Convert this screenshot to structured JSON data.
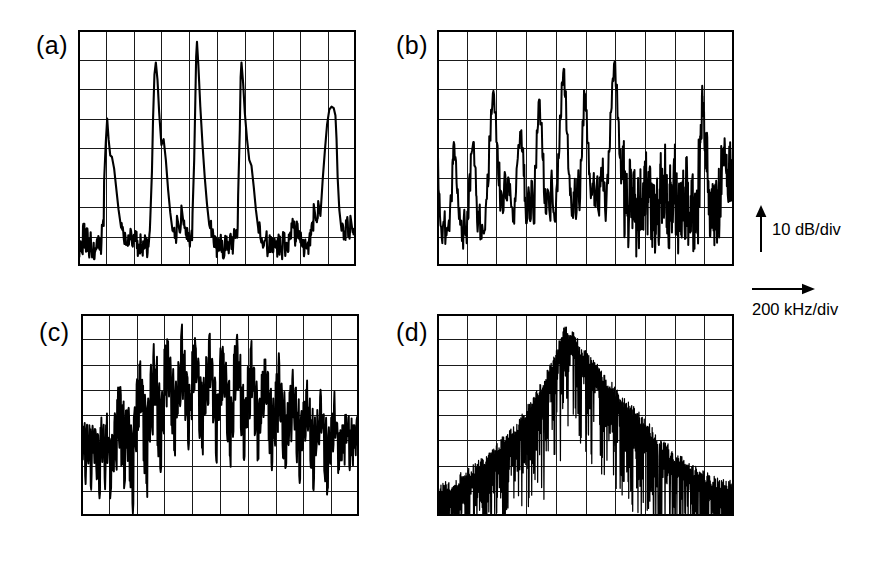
{
  "figure": {
    "type": "spectrum-analyzer-panels",
    "background_color": "#ffffff",
    "trace_color": "#000000",
    "grid_color": "#1a1a1a",
    "panel_count": 4
  },
  "labels": {
    "a": "(a)",
    "b": "(b)",
    "c": "(c)",
    "d": "(d)"
  },
  "legend": {
    "vertical_axis": "10 dB/div",
    "horizontal_axis": "200 kHz/div",
    "vertical_arrow_icon": "up-arrow-icon",
    "horizontal_arrow_icon": "right-arrow-icon"
  },
  "chart_data": [
    {
      "id": "a",
      "type": "line",
      "title": "(a)",
      "xlabel": "200 kHz/div",
      "ylabel": "10 dB/div",
      "xlim": [
        0,
        10
      ],
      "ylim": [
        0,
        8
      ],
      "grid": true,
      "x_divisions": 10,
      "y_divisions": 8,
      "description": "Periodic comb of sharp spectral peaks with low noise floor",
      "peaks_x": [
        1.05,
        2.7,
        4.25,
        5.85,
        7.75,
        9.3
      ],
      "peaks_y": [
        5.0,
        6.9,
        7.6,
        6.9,
        1.6,
        5.4
      ],
      "noise_floor_y": 0.55,
      "x": [
        0.0,
        0.06,
        0.12,
        0.18,
        0.24,
        0.3,
        0.36,
        0.42,
        0.48,
        0.55,
        0.62,
        0.7,
        0.78,
        0.86,
        0.94,
        1.0,
        1.05,
        1.1,
        1.16,
        1.22,
        1.3,
        1.38,
        1.46,
        1.55,
        1.65,
        1.75,
        1.85,
        1.95,
        2.05,
        2.12,
        2.2,
        2.28,
        2.36,
        2.44,
        2.52,
        2.6,
        2.66,
        2.7,
        2.75,
        2.8,
        2.86,
        2.92,
        3.0,
        3.08,
        3.16,
        3.24,
        3.32,
        3.4,
        3.48,
        3.56,
        3.64,
        3.72,
        3.8,
        3.88,
        3.96,
        4.04,
        4.12,
        4.18,
        4.22,
        4.25,
        4.28,
        4.33,
        4.4,
        4.48,
        4.56,
        4.64,
        4.72,
        4.8,
        4.88,
        4.96,
        5.04,
        5.12,
        5.2,
        5.28,
        5.36,
        5.44,
        5.52,
        5.6,
        5.68,
        5.76,
        5.82,
        5.85,
        5.88,
        5.94,
        6.0,
        6.08,
        6.16,
        6.24,
        6.32,
        6.4,
        6.48,
        6.56,
        6.64,
        6.72,
        6.8,
        6.88,
        6.96,
        7.04,
        7.12,
        7.2,
        7.28,
        7.36,
        7.44,
        7.52,
        7.6,
        7.68,
        7.72,
        7.75,
        7.8,
        7.86,
        7.92,
        8.0,
        8.08,
        8.16,
        8.24,
        8.32,
        8.4,
        8.48,
        8.56,
        8.64,
        8.72,
        8.8,
        8.88,
        8.96,
        9.04,
        9.12,
        9.2,
        9.26,
        9.3,
        9.34,
        9.4,
        9.48,
        9.56,
        9.64,
        9.72,
        9.8,
        9.88,
        9.96,
        10.0
      ],
      "y": [
        0.55,
        0.7,
        0.5,
        1.35,
        0.62,
        1.25,
        0.5,
        0.8,
        0.55,
        0.45,
        0.5,
        0.62,
        0.55,
        1.4,
        2.9,
        4.2,
        5.0,
        4.3,
        3.75,
        3.7,
        3.3,
        2.6,
        1.9,
        1.3,
        0.9,
        0.75,
        0.95,
        0.7,
        0.85,
        0.6,
        0.72,
        0.58,
        0.8,
        0.62,
        0.9,
        1.6,
        3.2,
        5.0,
        6.5,
        6.9,
        6.3,
        5.2,
        4.1,
        4.3,
        3.6,
        2.6,
        1.8,
        1.2,
        0.95,
        1.7,
        1.25,
        2.05,
        1.4,
        1.05,
        0.85,
        0.95,
        1.8,
        3.6,
        5.6,
        7.1,
        7.6,
        6.8,
        5.4,
        4.1,
        3.0,
        2.1,
        1.4,
        1.0,
        0.8,
        0.62,
        0.6,
        0.7,
        0.55,
        0.72,
        0.6,
        0.8,
        0.58,
        0.95,
        1.1,
        2.4,
        4.6,
        6.4,
        6.9,
        6.2,
        5.2,
        4.3,
        3.6,
        3.4,
        2.7,
        1.9,
        1.3,
        0.95,
        0.75,
        0.85,
        0.6,
        0.72,
        0.55,
        0.8,
        0.62,
        0.7,
        0.58,
        0.85,
        0.6,
        0.75,
        0.9,
        1.45,
        1.6,
        1.3,
        0.9,
        1.35,
        0.95,
        0.8,
        0.65,
        0.85,
        0.62,
        0.95,
        1.35,
        2.1,
        1.55,
        2.2,
        1.7,
        2.9,
        3.9,
        4.8,
        5.3,
        5.4,
        5.35,
        5.1,
        4.3,
        3.0,
        1.9,
        1.2,
        0.9,
        1.55,
        1.0,
        1.7,
        1.15
      ]
    },
    {
      "id": "b",
      "type": "line",
      "title": "(b)",
      "xlabel": "200 kHz/div",
      "ylabel": "10 dB/div",
      "xlim": [
        0,
        10
      ],
      "ylim": [
        0,
        8
      ],
      "grid": true,
      "x_divisions": 10,
      "y_divisions": 8,
      "description": "Irregular multi-peak spectrum with elevated noise, peaks decaying toward right",
      "peaks_x": [
        0.55,
        1.35,
        2.15,
        2.95,
        3.55,
        4.25,
        4.95,
        5.55,
        6.25,
        7.55,
        8.95,
        9.65
      ],
      "peaks_y": [
        4.05,
        4.05,
        5.85,
        4.55,
        5.55,
        6.55,
        5.95,
        6.05,
        6.85,
        4.55,
        5.75,
        3.95
      ],
      "noise_floor_y": 1.2,
      "x": [
        0.0,
        0.05,
        0.1,
        0.16,
        0.22,
        0.28,
        0.34,
        0.4,
        0.46,
        0.52,
        0.55,
        0.6,
        0.66,
        0.72,
        0.78,
        0.84,
        0.9,
        0.96,
        1.02,
        1.08,
        1.14,
        1.2,
        1.26,
        1.32,
        1.35,
        1.4,
        1.46,
        1.52,
        1.58,
        1.64,
        1.7,
        1.76,
        1.82,
        1.88,
        1.94,
        2.0,
        2.06,
        2.12,
        2.15,
        2.2,
        2.26,
        2.32,
        2.38,
        2.44,
        2.5,
        2.56,
        2.62,
        2.68,
        2.74,
        2.8,
        2.86,
        2.92,
        2.95,
        3.0,
        3.06,
        3.12,
        3.18,
        3.24,
        3.3,
        3.36,
        3.42,
        3.48,
        3.55,
        3.6,
        3.66,
        3.72,
        3.78,
        3.84,
        3.9,
        3.96,
        4.02,
        4.08,
        4.14,
        4.2,
        4.25,
        4.3,
        4.36,
        4.42,
        4.48,
        4.54,
        4.6,
        4.66,
        4.72,
        4.78,
        4.84,
        4.9,
        4.95,
        5.0,
        5.06,
        5.12,
        5.18,
        5.24,
        5.3,
        5.36,
        5.42,
        5.48,
        5.55,
        5.6,
        5.66,
        5.72,
        5.78,
        5.84,
        5.9,
        5.96,
        6.02,
        6.08,
        6.14,
        6.2,
        6.25,
        6.3,
        6.36,
        6.42,
        6.48,
        6.54,
        6.6,
        6.66,
        6.72,
        6.78,
        6.84,
        6.9,
        6.96,
        7.02,
        7.08,
        7.14,
        7.2,
        7.26,
        7.32,
        7.38,
        7.44,
        7.5,
        7.55,
        7.6,
        7.66,
        7.72,
        7.78,
        7.84,
        7.9,
        7.96,
        8.02,
        8.08,
        8.14,
        8.2,
        8.26,
        8.32,
        8.38,
        8.44,
        8.5,
        8.56,
        8.62,
        8.68,
        8.74,
        8.8,
        8.86,
        8.92,
        8.95,
        9.0,
        9.06,
        9.12,
        9.18,
        9.24,
        9.3,
        9.36,
        9.42,
        9.48,
        9.54,
        9.6,
        9.65,
        9.7,
        9.76,
        9.82,
        9.88,
        9.94,
        10.0
      ],
      "y": [
        3.7,
        2.6,
        1.7,
        0.95,
        1.5,
        0.75,
        1.3,
        1.55,
        2.4,
        3.5,
        4.05,
        3.6,
        2.8,
        2.0,
        1.4,
        0.85,
        1.6,
        1.05,
        1.85,
        2.95,
        3.8,
        4.05,
        3.4,
        2.4,
        1.5,
        1.85,
        0.9,
        1.4,
        1.1,
        1.95,
        3.1,
        4.4,
        5.3,
        5.85,
        5.2,
        4.2,
        3.1,
        2.3,
        2.55,
        2.2,
        2.75,
        2.3,
        2.95,
        2.4,
        2.0,
        1.5,
        2.3,
        3.3,
        4.1,
        4.55,
        3.9,
        3.05,
        2.2,
        1.45,
        2.4,
        1.6,
        2.9,
        1.8,
        3.4,
        4.6,
        5.55,
        4.8,
        3.7,
        2.5,
        1.8,
        2.6,
        1.9,
        2.9,
        2.1,
        1.55,
        2.6,
        3.8,
        5.1,
        6.2,
        6.55,
        5.8,
        4.6,
        3.3,
        2.4,
        1.7,
        2.5,
        1.8,
        2.95,
        2.2,
        3.6,
        4.9,
        5.95,
        5.3,
        4.2,
        3.1,
        2.3,
        2.8,
        2.05,
        2.6,
        1.95,
        3.0,
        3.25,
        2.55,
        1.9,
        2.7,
        3.9,
        5.2,
        6.2,
        6.85,
        6.1,
        5.0,
        3.8,
        2.8,
        2.95,
        2.1,
        2.55,
        1.8,
        2.4,
        1.65,
        2.2,
        1.5,
        1.95,
        1.4,
        2.15,
        1.7,
        2.4,
        2.75,
        2.0,
        2.5,
        1.75,
        2.3,
        1.55,
        2.1,
        1.4,
        2.6,
        2.45,
        1.85,
        2.95,
        2.2,
        1.6,
        2.4,
        1.75,
        2.85,
        2.1,
        1.5,
        2.25,
        1.7,
        2.5,
        1.95,
        2.4,
        1.75,
        1.3,
        2.05,
        1.55,
        2.3,
        1.85,
        3.1,
        4.4,
        5.75,
        5.2,
        4.3,
        3.3,
        2.5,
        1.8,
        2.4,
        1.7,
        2.25,
        1.6,
        2.15,
        2.8,
        3.6,
        3.95,
        3.4,
        2.7,
        3.2,
        2.8,
        3.3,
        3.1
      ]
    },
    {
      "id": "c",
      "type": "line",
      "title": "(c)",
      "xlabel": "200 kHz/div",
      "ylabel": "10 dB/div",
      "xlim": [
        0,
        10
      ],
      "ylim": [
        0,
        8
      ],
      "grid": true,
      "x_divisions": 10,
      "y_divisions": 8,
      "description": "Dense rapid oscillation with broad central hump, high noise throughout",
      "peak_region_x": [
        3.0,
        7.0
      ],
      "peak_y": 7.1,
      "noise_floor_y": 2.0,
      "x": [
        0.0,
        0.05,
        0.1,
        0.15,
        0.2,
        0.25,
        0.3,
        0.35,
        0.4,
        0.45,
        0.5,
        0.55,
        0.6,
        0.65,
        0.7,
        0.75,
        0.8,
        0.85,
        0.9,
        0.95,
        1.0,
        1.05,
        1.1,
        1.15,
        1.2,
        1.25,
        1.3,
        1.35,
        1.4,
        1.45,
        1.5,
        1.55,
        1.6,
        1.65,
        1.7,
        1.75,
        1.8,
        1.85,
        1.9,
        1.95,
        2.0,
        2.05,
        2.1,
        2.15,
        2.2,
        2.25,
        2.3,
        2.35,
        2.4,
        2.45,
        2.5,
        2.55,
        2.6,
        2.65,
        2.7,
        2.75,
        2.8,
        2.85,
        2.9,
        2.95,
        3.0,
        3.05,
        3.1,
        3.15,
        3.2,
        3.25,
        3.3,
        3.35,
        3.4,
        3.45,
        3.5,
        3.55,
        3.6,
        3.65,
        3.7,
        3.75,
        3.8,
        3.85,
        3.9,
        3.95,
        4.0,
        4.05,
        4.1,
        4.15,
        4.2,
        4.25,
        4.3,
        4.35,
        4.4,
        4.45,
        4.5,
        4.55,
        4.6,
        4.65,
        4.7,
        4.75,
        4.8,
        4.85,
        4.9,
        4.95,
        5.0,
        5.05,
        5.1,
        5.15,
        5.2,
        5.25,
        5.3,
        5.35,
        5.4,
        5.45,
        5.5,
        5.55,
        5.6,
        5.65,
        5.7,
        5.75,
        5.8,
        5.85,
        5.9,
        5.95,
        6.0,
        6.05,
        6.1,
        6.15,
        6.2,
        6.25,
        6.3,
        6.35,
        6.4,
        6.45,
        6.5,
        6.55,
        6.6,
        6.65,
        6.7,
        6.75,
        6.8,
        6.85,
        6.9,
        6.95,
        7.0,
        7.05,
        7.1,
        7.15,
        7.2,
        7.25,
        7.3,
        7.35,
        7.4,
        7.45,
        7.5,
        7.55,
        7.6,
        7.65,
        7.7,
        7.75,
        7.8,
        7.85,
        7.9,
        7.95,
        8.0,
        8.05,
        8.1,
        8.15,
        8.2,
        8.25,
        8.3,
        8.35,
        8.4,
        8.45,
        8.5,
        8.55,
        8.6,
        8.65,
        8.7,
        8.75,
        8.8,
        8.85,
        8.9,
        8.95,
        9.0,
        9.05,
        9.1,
        9.15,
        9.2,
        9.25,
        9.3,
        9.35,
        9.4,
        9.45,
        9.5,
        9.55,
        9.6,
        9.65,
        9.7,
        9.75,
        9.8,
        9.85,
        9.9,
        9.95,
        10.0
      ],
      "y": [
        3.2,
        2.4,
        3.55,
        1.6,
        3.4,
        2.2,
        3.6,
        1.2,
        3.3,
        2.5,
        3.45,
        1.9,
        3.25,
        0.95,
        3.5,
        2.6,
        3.3,
        1.5,
        3.6,
        2.1,
        3.1,
        0.7,
        2.9,
        1.8,
        3.7,
        2.3,
        4.6,
        3.2,
        5.1,
        2.0,
        4.4,
        1.1,
        3.8,
        2.7,
        4.2,
        1.4,
        3.6,
        0.5,
        3.9,
        2.8,
        5.2,
        3.4,
        6.0,
        4.1,
        5.4,
        2.2,
        4.8,
        1.3,
        4.3,
        3.0,
        5.6,
        3.6,
        6.3,
        4.4,
        5.8,
        2.8,
        5.0,
        1.9,
        4.6,
        3.4,
        6.6,
        4.8,
        7.0,
        5.2,
        6.2,
        3.6,
        5.4,
        2.6,
        4.9,
        3.9,
        6.1,
        4.5,
        7.1,
        5.0,
        6.4,
        3.8,
        5.7,
        2.9,
        5.2,
        4.2,
        6.5,
        4.9,
        7.05,
        5.3,
        6.0,
        3.4,
        5.5,
        2.7,
        5.1,
        4.0,
        6.3,
        4.7,
        6.9,
        5.1,
        6.2,
        3.7,
        5.3,
        2.5,
        4.8,
        3.8,
        6.1,
        4.4,
        6.7,
        4.9,
        5.9,
        3.3,
        5.2,
        2.4,
        4.7,
        3.6,
        6.4,
        4.6,
        7.0,
        5.0,
        6.1,
        3.5,
        5.1,
        2.3,
        4.6,
        3.5,
        5.9,
        4.3,
        6.6,
        4.7,
        5.8,
        3.2,
        5.0,
        2.2,
        4.4,
        3.3,
        5.6,
        4.1,
        6.2,
        4.5,
        5.5,
        3.0,
        4.8,
        2.1,
        4.2,
        3.1,
        5.3,
        3.8,
        5.9,
        4.2,
        5.2,
        2.8,
        4.5,
        1.9,
        4.0,
        2.9,
        4.9,
        3.5,
        5.4,
        3.9,
        4.7,
        2.5,
        4.1,
        1.6,
        3.7,
        2.6,
        4.5,
        3.2,
        5.0,
        3.6,
        4.3,
        2.2,
        3.8,
        1.1,
        3.4,
        2.4,
        4.2,
        2.95,
        4.7,
        3.3,
        4.0,
        1.8,
        3.5,
        0.85,
        3.2,
        2.2,
        3.9,
        2.7,
        4.4,
        3.1,
        3.7,
        1.7,
        3.3,
        2.2,
        3.6,
        2.5,
        4.0,
        2.9,
        3.5,
        2.0,
        3.4,
        2.4,
        3.6,
        2.7,
        3.45,
        3.0
      ]
    },
    {
      "id": "d",
      "type": "line",
      "title": "(d)",
      "xlabel": "200 kHz/div",
      "ylabel": "10 dB/div",
      "xlim": [
        0,
        10
      ],
      "ylim": [
        0,
        8
      ],
      "grid": true,
      "x_divisions": 10,
      "y_divisions": 8,
      "description": "Broad noisy triangular envelope peaking near x=4.3, dense fine structure",
      "envelope_peak_x": 4.3,
      "envelope_peak_y": 7.6,
      "noise_floor_y": 1.3,
      "envelope_x": [
        0.0,
        0.5,
        1.0,
        1.5,
        2.0,
        2.5,
        3.0,
        3.5,
        4.0,
        4.3,
        4.6,
        5.0,
        5.5,
        6.0,
        6.5,
        7.0,
        7.5,
        8.0,
        8.5,
        9.0,
        9.5,
        10.0
      ],
      "envelope_y": [
        1.3,
        1.5,
        1.9,
        2.3,
        2.9,
        3.5,
        4.3,
        5.3,
        6.7,
        7.6,
        7.3,
        6.6,
        6.0,
        5.1,
        4.5,
        3.9,
        3.2,
        2.6,
        2.2,
        1.8,
        1.5,
        1.4
      ]
    }
  ]
}
